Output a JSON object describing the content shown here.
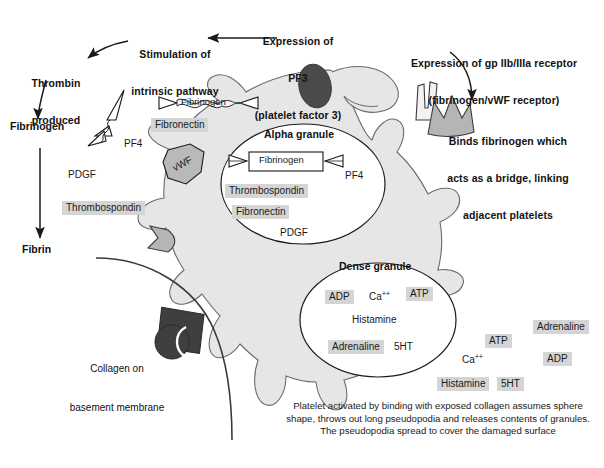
{
  "figure": {
    "domain": "biology-diagram",
    "title_visible": false,
    "bottom_caption": "Platelet activated by binding with exposed collagen assumes sphere shape, throws out long pseudopodia and releases contents of granules.  The pseudopodia spread to cover the damaged surface"
  },
  "colors": {
    "platelet_fill": "#e6e6e6",
    "platelet_stroke": "#555555",
    "granule_fill": "#ffffff",
    "granule_stroke": "#1a1a1a",
    "chip_bg": "#d5d5d5",
    "dark_shape": "#4a4a4a",
    "receptor_fill": "#b5b5b5",
    "line": "#1a1a1a",
    "collagen_line": "#3a3a3a",
    "text": "#111111"
  },
  "callouts": [
    {
      "name": "stimulation-intrinsic-pathway",
      "lines": [
        "Stimulation of",
        "intrinsic pathway"
      ]
    },
    {
      "name": "expression-pf3",
      "lines": [
        "Expression of",
        "PF3",
        "(platelet factor 3)"
      ]
    },
    {
      "name": "expression-gpiibiiia",
      "lines": [
        "Expression of gp IIb/IIIa receptor",
        "(fibrinogen/vWF receptor)"
      ]
    },
    {
      "name": "binds-fibrinogen-bridge",
      "lines": [
        "Binds fibrinogen which",
        "acts as a bridge, linking",
        "adjacent platelets"
      ]
    }
  ],
  "pathway_chain": [
    {
      "name": "thrombin-produced",
      "lines": [
        "Thrombin",
        "produced"
      ]
    },
    {
      "name": "fibrinogen-pathway",
      "lines": [
        "Fibrinogen"
      ]
    },
    {
      "name": "fibrin-pathway",
      "lines": [
        "Fibrin"
      ]
    }
  ],
  "collagen_label": {
    "lines": [
      "Collagen on",
      "basement membrane"
    ]
  },
  "granules": {
    "alpha": {
      "title": "Alpha granule",
      "boxed_molecule": "Fibrinogen",
      "contents": [
        {
          "label": "Thrombospondin",
          "highlight": true
        },
        {
          "label": "Fibronectin",
          "highlight": true
        },
        {
          "label": "PDGF",
          "highlight": false
        },
        {
          "label": "PF4",
          "highlight": false
        }
      ]
    },
    "dense": {
      "title": "Dense granule",
      "contents": [
        {
          "label": "ADP",
          "highlight": true
        },
        {
          "label": "Ca++",
          "highlight": false
        },
        {
          "label": "ATP",
          "highlight": true
        },
        {
          "label": "Histamine",
          "highlight": false
        },
        {
          "label": "Adrenaline",
          "highlight": true
        },
        {
          "label": "5HT",
          "highlight": false
        }
      ]
    }
  },
  "released_left": [
    {
      "label": "Fibrinogen",
      "highlight": false
    },
    {
      "label": "Fibronectin",
      "highlight": true
    },
    {
      "label": "PF4",
      "highlight": false
    },
    {
      "label": "vWF",
      "highlight": false
    },
    {
      "label": "PDGF",
      "highlight": false
    },
    {
      "label": "Thrombospondin",
      "highlight": true
    }
  ],
  "released_right": [
    {
      "label": "Adrenaline",
      "highlight": true
    },
    {
      "label": "ATP",
      "highlight": true
    },
    {
      "label": "ADP",
      "highlight": true
    },
    {
      "label": "Ca++",
      "highlight": false
    },
    {
      "label": "Histamine",
      "highlight": true
    },
    {
      "label": "5HT",
      "highlight": true
    }
  ],
  "molecule_shapes": [
    {
      "name": "fibrinogen-dumbbell-free",
      "label": "Fibrinogen"
    },
    {
      "name": "fibrinogen-dumbbell-boxed",
      "label": "Fibrinogen"
    },
    {
      "name": "vwf-polygon",
      "label": "vWF"
    },
    {
      "name": "pf4-zigzag",
      "label": "PF4"
    },
    {
      "name": "gpiibiiia-receptor-spike",
      "label": ""
    },
    {
      "name": "gpiibiiia-receptor-crown",
      "label": ""
    },
    {
      "name": "pf3-dark-ellipse",
      "label": ""
    },
    {
      "name": "collagen-binding-dark-block",
      "label": ""
    }
  ]
}
